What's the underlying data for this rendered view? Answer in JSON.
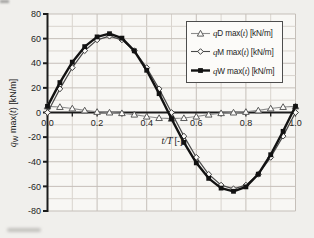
{
  "figure": {
    "ylabel": {
      "q": "q",
      "sub": "W",
      "mid": " max(",
      "t": "t",
      "close": ") [kN/m]"
    },
    "xlabel": {
      "var": "t/T",
      "unit": "[-]"
    }
  },
  "legend": {
    "items": [
      {
        "q": "q",
        "letter": "D",
        "mid": " max(",
        "t": "t",
        "close": ") [kN/m]",
        "marker": "triangle"
      },
      {
        "q": "q",
        "letter": "M",
        "mid": " max(",
        "t": "t",
        "close": ") [kN/m]",
        "marker": "diamond"
      },
      {
        "q": "q",
        "letter": "W",
        "mid": " max(",
        "t": "t",
        "close": ") [kN/m]",
        "marker": "square"
      }
    ]
  },
  "chart_data": {
    "type": "line",
    "title": "",
    "xlabel": "t/T [-]",
    "ylabel": "qW max(t) [kN/m]",
    "xlim": [
      0,
      1
    ],
    "ylim": [
      -80,
      80
    ],
    "x_ticks": {
      "values": [
        0,
        0.2,
        0.4,
        0.6,
        0.8,
        1.0
      ],
      "labels": [
        "0.0",
        "0.2",
        "0.4",
        "0.6",
        "0.8",
        "1.0"
      ]
    },
    "y_ticks": {
      "values": [
        -80,
        -60,
        -40,
        -20,
        0,
        20,
        40,
        60,
        80
      ],
      "labels": [
        "-80",
        "-60",
        "-40",
        "-20",
        "0",
        "20",
        "40",
        "60",
        "80"
      ]
    },
    "grid": {
      "x_minor_step": 0.1,
      "x_major_step": 0.2,
      "y_minor_step": 10,
      "y_major_step": 20,
      "grid_on": true
    },
    "legend_position": "top-right",
    "x": [
      0,
      0.05,
      0.1,
      0.15,
      0.2,
      0.25,
      0.3,
      0.35,
      0.4,
      0.45,
      0.5,
      0.55,
      0.6,
      0.65,
      0.7,
      0.75,
      0.8,
      0.85,
      0.9,
      0.95,
      1.0
    ],
    "series": [
      {
        "id": "qD",
        "name": "qD max(t) [kN/m]",
        "marker": "triangle",
        "color": "#8c8c8c",
        "marker_color": "#5a5a5a",
        "width": 1.1,
        "values": [
          5,
          4.5,
          3.3,
          1.7,
          0.5,
          0,
          -0.5,
          -1.7,
          -3.3,
          -4.5,
          -5,
          -4.5,
          -3.3,
          -1.7,
          -0.5,
          0,
          0.5,
          1.7,
          3.3,
          4.5,
          5
        ]
      },
      {
        "id": "qM",
        "name": "qM max(t) [kN/m]",
        "marker": "diamond",
        "color": "#4a4a4a",
        "marker_color": "#3a3a3a",
        "width": 1.2,
        "values": [
          0,
          19.2,
          36.4,
          50.2,
          59,
          62,
          59,
          50.2,
          36.4,
          19.2,
          0,
          -19.2,
          -36.4,
          -50.2,
          -59,
          -62,
          -59,
          -50.2,
          -36.4,
          -19.2,
          0
        ]
      },
      {
        "id": "qW",
        "name": "qW max(t) [kN/m]",
        "marker": "square",
        "color": "#121212",
        "marker_color": "#121212",
        "width": 2.4,
        "values": [
          5,
          24.3,
          40.9,
          53.5,
          61.4,
          64,
          60.4,
          50.1,
          34.3,
          15.3,
          -5,
          -24.3,
          -40.9,
          -53.5,
          -61.4,
          -64,
          -60.4,
          -50.1,
          -34.3,
          -15.3,
          5
        ]
      }
    ],
    "colors": {
      "grid_minor": "#d9d4ce",
      "grid_major": "#c5bfb9",
      "axis": "#1c1c1c",
      "plot_bg": "#f8f7f4",
      "page_bg": "#f0efec",
      "text": "#1e1e1e",
      "legend_border": "#4d4d4d",
      "legend_bg": "#fcfbf9"
    }
  }
}
